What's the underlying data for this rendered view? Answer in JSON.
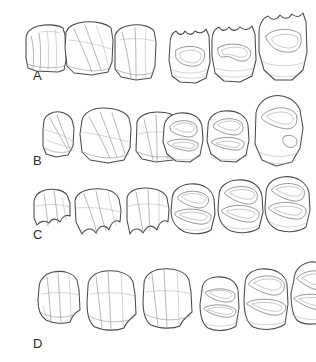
{
  "figure": {
    "type": "scientific-line-drawing",
    "background_color": "#ffffff",
    "ink_color": "#4a4a4a",
    "panel_count": 4,
    "columns": [
      {
        "id": "lateral",
        "name": "lateral-view-column",
        "description": "buccal/lateral side view of three-tooth row"
      },
      {
        "id": "occlusal",
        "name": "occlusal-view-column",
        "description": "occlusal chewing-surface view of three-tooth row"
      }
    ],
    "panels": [
      {
        "label": "A",
        "name": "panel-a",
        "teeth_per_view": 3,
        "lateral_note": "tall simple crowns, smooth buccal face, faint vertical ridges",
        "occlusal_note": "elongate enamel basins, crenulated outer margin"
      },
      {
        "label": "B",
        "name": "panel-b",
        "teeth_per_view": 3,
        "lateral_note": "low wide crowns with oblique ridges",
        "occlusal_note": "complex folded enamel islands, rounded outlines"
      },
      {
        "label": "C",
        "name": "panel-c",
        "teeth_per_view": 3,
        "lateral_note": "lobed wavy basal margin, bifid cusp tips",
        "occlusal_note": "rounded crowns with intricate looping enamel lakes"
      },
      {
        "label": "D",
        "name": "panel-d",
        "teeth_per_view": 3,
        "lateral_note": "tallest crowns, strong vertical grooves",
        "occlusal_note": "broad basins with sweeping crescentic enamel bands"
      }
    ]
  },
  "labels": {
    "a": "A",
    "b": "B",
    "c": "C",
    "d": "D"
  }
}
